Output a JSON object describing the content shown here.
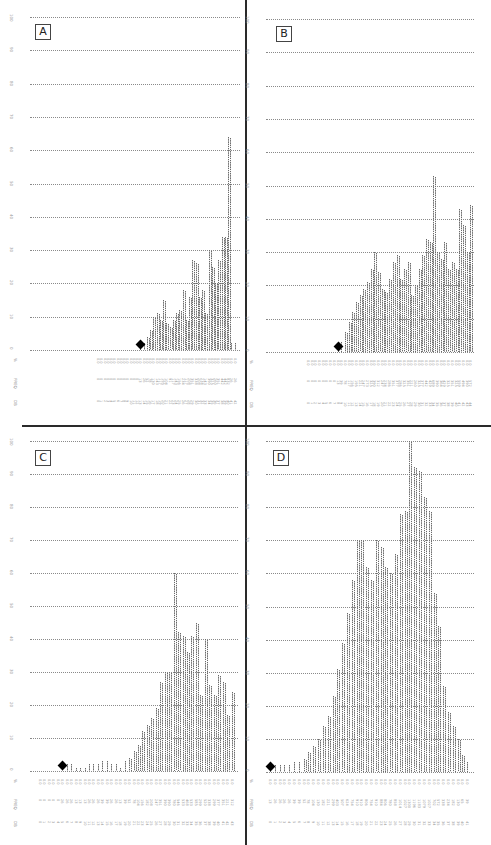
{
  "figure": {
    "panel_labels": [
      "A",
      "B",
      "C",
      "D"
    ],
    "row_labels": [
      "%",
      "FREQ",
      "DB"
    ],
    "y_ticks": [
      "0",
      "10",
      "20",
      "30",
      "40",
      "50",
      "60",
      "70",
      "80",
      "90",
      "100"
    ],
    "colors": {
      "dots": "#6a6a6a",
      "grid": "#8a8a8a",
      "marker": "#000000",
      "divider": "#2a2a2a"
    }
  },
  "chart_data": [
    {
      "type": "bar",
      "title": "A",
      "ylabel": "%",
      "ylim": [
        0,
        100
      ],
      "yticks": [
        0,
        10,
        20,
        30,
        40,
        50,
        60,
        70,
        80,
        90,
        100
      ],
      "grid": true,
      "style": "dot-matrix histogram",
      "row_labels": [
        "%",
        "FREQ",
        "DB"
      ],
      "marker_index": 13,
      "values": [
        0,
        0,
        0,
        0,
        0,
        0,
        0,
        0,
        0,
        0,
        0,
        0,
        0,
        1,
        2,
        4,
        6,
        10,
        11,
        9,
        15,
        8,
        7,
        9,
        11,
        12,
        18,
        9,
        16,
        27,
        26,
        16,
        18,
        11,
        30,
        25,
        20,
        27,
        34,
        34,
        64,
        2,
        2
      ]
    },
    {
      "type": "bar",
      "title": "B",
      "ylabel": "%",
      "ylim": [
        0,
        100
      ],
      "yticks": [
        0,
        10,
        20,
        30,
        40,
        50,
        60,
        70,
        80,
        90,
        100
      ],
      "grid": true,
      "style": "dot-matrix histogram",
      "row_labels": [
        "%",
        "FREQ",
        "DB"
      ],
      "marker_index": 8,
      "values": [
        0,
        0,
        0,
        0,
        0,
        0,
        0,
        0,
        1,
        3,
        6,
        9,
        12,
        15,
        17,
        19,
        21,
        25,
        30,
        24,
        19,
        18,
        22,
        27,
        29,
        22,
        25,
        27,
        17,
        20,
        25,
        29,
        34,
        33,
        53,
        30,
        28,
        33,
        25,
        27,
        25,
        43,
        38,
        30,
        44
      ]
    },
    {
      "type": "bar",
      "title": "C",
      "ylabel": "%",
      "ylim": [
        0,
        100
      ],
      "yticks": [
        0,
        10,
        20,
        30,
        40,
        50,
        60,
        70,
        80,
        90,
        100
      ],
      "grid": true,
      "style": "dot-matrix histogram",
      "row_labels": [
        "%",
        "FREQ",
        "DB"
      ],
      "marker_index": 5,
      "values": [
        0,
        0,
        0,
        0,
        0,
        2,
        2,
        2,
        1,
        1,
        1,
        2,
        2,
        2,
        3,
        3,
        2,
        2,
        1,
        3,
        4,
        6,
        8,
        12,
        14,
        16,
        19,
        27,
        30,
        30,
        60,
        42,
        41,
        36,
        41,
        45,
        23,
        40,
        26,
        23,
        29,
        27,
        17,
        24
      ]
    },
    {
      "type": "bar",
      "title": "D",
      "ylabel": "%",
      "ylim": [
        0,
        100
      ],
      "yticks": [
        0,
        10,
        20,
        30,
        40,
        50,
        60,
        70,
        80,
        90,
        100
      ],
      "grid": true,
      "style": "dot-matrix histogram",
      "row_labels": [
        "%",
        "FREQ",
        "DB"
      ],
      "marker_index": 0,
      "values": [
        1,
        2,
        2,
        2,
        2,
        3,
        3,
        4,
        6,
        8,
        10,
        14,
        17,
        23,
        31,
        39,
        48,
        58,
        70,
        70,
        62,
        58,
        70,
        68,
        62,
        60,
        66,
        78,
        79,
        100,
        92,
        91,
        83,
        79,
        54,
        44,
        26,
        18,
        14,
        10,
        5,
        3
      ]
    }
  ]
}
